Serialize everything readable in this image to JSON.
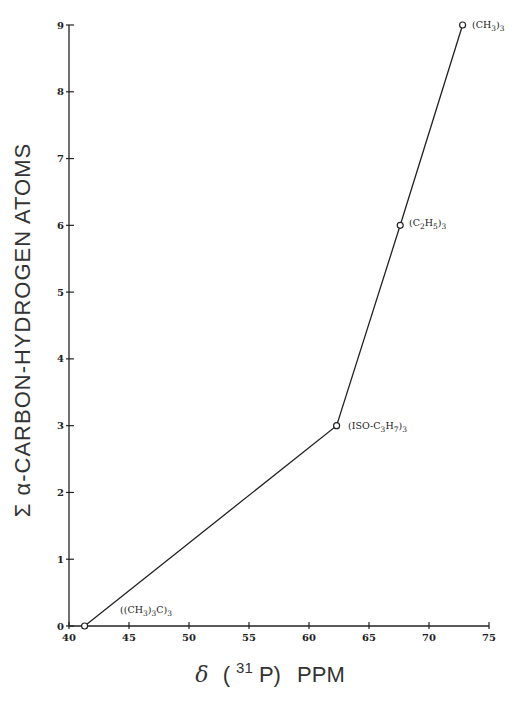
{
  "chart_data": {
    "type": "line",
    "title": "",
    "xlabel": "δ (31P) PPM",
    "xlabel_parts": {
      "delta": "δ",
      "open": "(",
      "sup": "31",
      "p": "P)",
      "unit": "PPM"
    },
    "ylabel": "Σ α-CARBON-HYDROGEN ATOMS",
    "xlim": [
      40,
      75
    ],
    "ylim": [
      0,
      9
    ],
    "x_ticks": [
      40,
      45,
      50,
      55,
      60,
      65,
      70,
      75
    ],
    "y_ticks": [
      0,
      1,
      2,
      3,
      4,
      5,
      6,
      7,
      8,
      9
    ],
    "grid": false,
    "legend": null,
    "series": [
      {
        "name": "alpha C-H count vs 31P shift",
        "marker": "open-circle",
        "color": "#222222",
        "points": [
          {
            "x": 41.3,
            "y": 0,
            "label": "((CH3)3C)3"
          },
          {
            "x": 62.3,
            "y": 3,
            "label": "(ISO-C3H7)3"
          },
          {
            "x": 67.6,
            "y": 6,
            "label": "(C2H5)3"
          },
          {
            "x": 72.8,
            "y": 9,
            "label": "(CH3)3"
          }
        ]
      }
    ]
  },
  "annotations": [
    {
      "id": "tbu",
      "main": "((CH",
      "parts": [
        [
          "((CH",
          ""
        ],
        [
          "3",
          "sub"
        ],
        [
          ")",
          ""
        ],
        [
          "3",
          "sub"
        ],
        [
          "C)",
          ""
        ],
        [
          "3",
          "sub"
        ]
      ]
    },
    {
      "id": "ipr",
      "parts": [
        [
          "(ISO-C",
          ""
        ],
        [
          "3",
          "sub"
        ],
        [
          "H",
          ""
        ],
        [
          "7",
          "sub"
        ],
        [
          ")",
          ""
        ],
        [
          "3",
          "sub"
        ]
      ]
    },
    {
      "id": "et",
      "parts": [
        [
          "(C",
          ""
        ],
        [
          "2",
          "sub"
        ],
        [
          "H",
          ""
        ],
        [
          "5",
          "sub"
        ],
        [
          ")",
          ""
        ],
        [
          "3",
          "sub"
        ]
      ]
    },
    {
      "id": "me",
      "parts": [
        [
          "(CH",
          ""
        ],
        [
          "3",
          "sub"
        ],
        [
          ")",
          ""
        ],
        [
          "3",
          "sub"
        ]
      ]
    }
  ],
  "colors": {
    "ink": "#222222",
    "background": "#ffffff"
  }
}
